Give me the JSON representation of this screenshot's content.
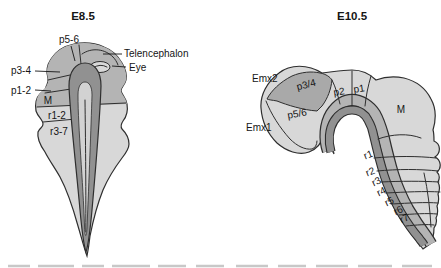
{
  "figure": {
    "background": "#ffffff",
    "colors": {
      "bg": "#ffffff",
      "light": "#d8d8d8",
      "mid": "#b4b4b4",
      "middark": "#a9a9a9",
      "dark": "#919191",
      "slot": "#d2d2d2",
      "outline": "#2e2e2e"
    },
    "panel_e85": {
      "title": "E8.5",
      "labels": {
        "p56": "p5-6",
        "telencephalon": "Telencephalon",
        "eye": "Eye",
        "p34": "p3-4",
        "p12": "p1-2",
        "m": "M",
        "r12": "r1-2",
        "r37": "r3-7"
      }
    },
    "panel_e105": {
      "title": "E10.5",
      "labels": {
        "emx2": "Emx2",
        "emx1": "Emx1",
        "p34": "p3/4",
        "p2": "p2",
        "p1": "p1",
        "m": "M",
        "p56": "p5/6",
        "r1": "r1",
        "r2": "r2",
        "r3": "r3",
        "r4": "r4",
        "r5": "r5",
        "r6": "r6",
        "r7": "r7"
      }
    }
  }
}
